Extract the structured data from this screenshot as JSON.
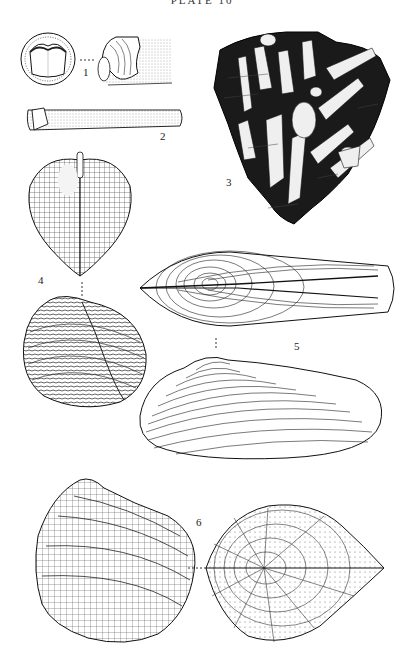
{
  "plate": {
    "header": "PLATE 10"
  },
  "figures": [
    {
      "number": "1",
      "description": "tubular shell with valves, end view and lateral view"
    },
    {
      "number": "2",
      "description": "elongate tubular shell, lateral view"
    },
    {
      "number": "3",
      "description": "rock slab with numerous embedded elongate shells"
    },
    {
      "number": "4",
      "description": "cordate ribbed bivalve, dorsal view and lateral view"
    },
    {
      "number": "5",
      "description": "elongate concentric-lined bivalve, dorsal view and lateral view"
    },
    {
      "number": "6",
      "description": "triangular cancellate bivalve, lateral view and dorsal view"
    }
  ],
  "colors": {
    "ink": "#111111",
    "paper": "#ffffff",
    "matrix": "#1a1a1a"
  }
}
